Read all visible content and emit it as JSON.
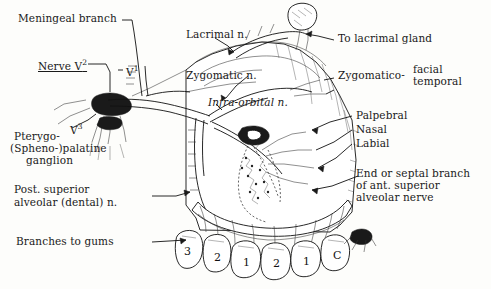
{
  "figure": {
    "labels": {
      "meningeal_branch": "Meningeal branch",
      "lacrimal_n": "Lacrimal n.",
      "to_lacrimal_gland": "To lacrimal gland",
      "nerve_v2": "Nerve V",
      "nerve_v2_sup": "2",
      "v1": "V",
      "v1_sup": "1",
      "zygomatic_n": "Zygomatic n.",
      "zygomatico": "Zygomatico-",
      "facial": "facial",
      "temporal": "temporal",
      "infraorbital": "Infra-orbital n.",
      "palpebral": "Palpebral",
      "nasal": "Nasal",
      "labial": "Labial",
      "v3": "V",
      "v3_sup": "3",
      "pterygo": "Pterygo-",
      "sphenopalatine": "(Spheno-)palatine",
      "ganglion": "ganglion",
      "end_or_septal_1": "End or septal branch",
      "end_or_septal_2": "of ant. superior",
      "end_or_septal_3": "alveolar nerve",
      "post_sup_1": "Post. superior",
      "post_sup_2": "alveolar (dental) n.",
      "branches_to_gums": "Branches to gums"
    },
    "teeth": [
      "3",
      "2",
      "1",
      "2",
      "1",
      "C"
    ],
    "colors": {
      "ink": "#1a1a1a",
      "paper": "#fdfdfb",
      "shade": "#e9e9e4"
    }
  }
}
